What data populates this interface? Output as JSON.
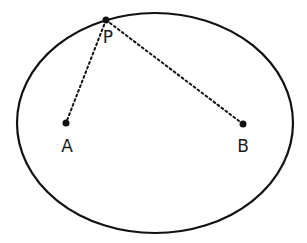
{
  "diagram": {
    "type": "ellipse-foci",
    "curve": "ellipse",
    "points": [
      {
        "id": "P",
        "label": "P",
        "role": "point on ellipse"
      },
      {
        "id": "A",
        "label": "A",
        "role": "focus"
      },
      {
        "id": "B",
        "label": "B",
        "role": "focus"
      }
    ],
    "segments": [
      {
        "from": "P",
        "to": "A",
        "style": "dotted"
      },
      {
        "from": "P",
        "to": "B",
        "style": "dotted"
      }
    ],
    "colors": {
      "stroke": "#111111",
      "background": "#ffffff"
    }
  }
}
